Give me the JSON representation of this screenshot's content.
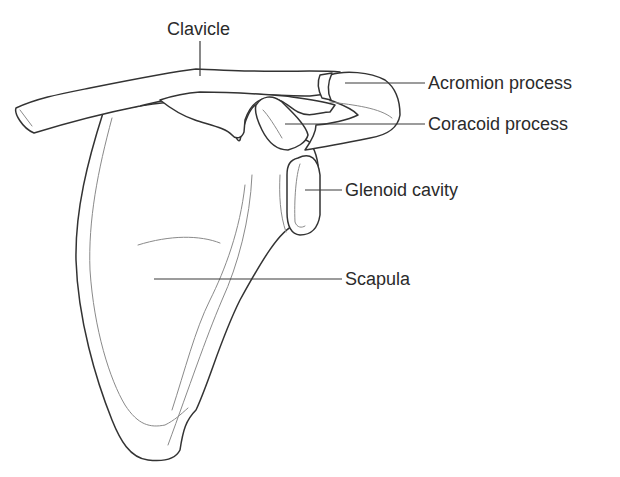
{
  "diagram": {
    "labels": [
      {
        "id": "clavicle",
        "text": "Clavicle"
      },
      {
        "id": "acromion",
        "text": "Acromion process"
      },
      {
        "id": "coracoid",
        "text": "Coracoid process"
      },
      {
        "id": "glenoid",
        "text": "Glenoid cavity"
      },
      {
        "id": "scapula",
        "text": "Scapula"
      }
    ],
    "colors": {
      "outline": "#333333",
      "inner_line": "#8a8a8a",
      "text": "#2b2b2b",
      "background": "#ffffff"
    }
  }
}
